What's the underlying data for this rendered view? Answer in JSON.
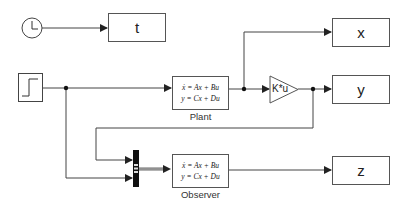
{
  "diagram": {
    "type": "simulink-block-diagram",
    "blocks": {
      "clock": {
        "icon": "clock-icon"
      },
      "step": {
        "icon": "step-icon"
      },
      "t_out": {
        "label": "t"
      },
      "x_out": {
        "label": "x"
      },
      "y_out": {
        "label": "y"
      },
      "z_out": {
        "label": "z"
      },
      "plant": {
        "eq1": "ẋ = Ax + Bu",
        "eq2": "y = Cx + Du",
        "name": "Plant"
      },
      "observer": {
        "eq1": "ẋ = Ax + Bu",
        "eq2": "y = Cx + Du",
        "name": "Observer"
      },
      "gain": {
        "label": "K*u"
      },
      "mux": {
        "icon": "mux-icon"
      }
    },
    "colors": {
      "line": "#444444",
      "border": "#555555",
      "background": "#ffffff"
    }
  }
}
